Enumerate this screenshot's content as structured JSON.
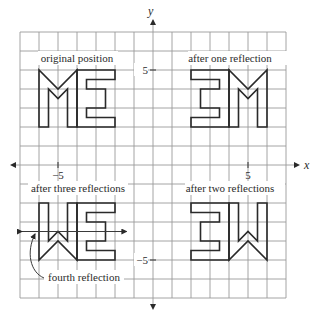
{
  "diagram": {
    "type": "coordinate-plane-reflections",
    "axes": {
      "x_label": "x",
      "y_label": "y",
      "x_range": [
        -7,
        7
      ],
      "y_range": [
        -7,
        7
      ],
      "grid_step": 1,
      "ticks": {
        "x_neg": {
          "value": -5,
          "label": "−5"
        },
        "x_pos": {
          "value": 5,
          "label": "5"
        },
        "y_pos": {
          "value": 5,
          "label": "5"
        },
        "y_neg": {
          "value": -5,
          "label": "−5"
        }
      }
    },
    "labels": {
      "original": "original position",
      "one": "after one reflection",
      "two": "after two reflections",
      "three": "after three reflections",
      "fourth": "fourth reflection"
    },
    "shapes": [
      {
        "name": "original-M",
        "quadrant": "original",
        "points": [
          [
            -6,
            2
          ],
          [
            -6,
            5
          ],
          [
            -5,
            4
          ],
          [
            -4,
            5
          ],
          [
            -4,
            2
          ],
          [
            -4.5,
            2
          ],
          [
            -4.5,
            4
          ],
          [
            -5,
            3.5
          ],
          [
            -5.5,
            4
          ],
          [
            -5.5,
            2
          ]
        ]
      },
      {
        "name": "original-E",
        "quadrant": "original",
        "points": [
          [
            -4,
            2
          ],
          [
            -4,
            5
          ],
          [
            -2,
            5
          ],
          [
            -2,
            4.5
          ],
          [
            -3.5,
            4.5
          ],
          [
            -3.5,
            4
          ],
          [
            -2.5,
            4
          ],
          [
            -2.5,
            3
          ],
          [
            -3.5,
            3
          ],
          [
            -3.5,
            2.5
          ],
          [
            -2,
            2.5
          ],
          [
            -2,
            2
          ]
        ]
      }
    ],
    "transforms": {
      "original": [
        1,
        1
      ],
      "one": [
        -1,
        1
      ],
      "two": [
        -1,
        -1
      ],
      "three": [
        1,
        -1
      ]
    },
    "fourth_reflection_line": {
      "y": -3.5,
      "x_from": -6.9,
      "x_to": -1.4
    },
    "colors": {
      "grid": "#9a9a9a",
      "letters": "#2a2a2a",
      "text": "#2b2b2b"
    }
  }
}
